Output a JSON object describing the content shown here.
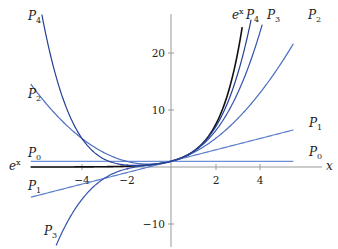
{
  "chart_data": {
    "type": "line",
    "title": "",
    "xlabel": "x",
    "ylabel": "",
    "xlim": [
      -6.5,
      6.3
    ],
    "ylim": [
      -12,
      27
    ],
    "grid": false,
    "x_ticks": [
      -4,
      -2,
      2,
      4
    ],
    "y_ticks": [
      -10,
      10,
      20
    ],
    "x_tick_labels": [
      "−4",
      "−2",
      "2",
      "4"
    ],
    "y_tick_labels": [
      "−10",
      "10",
      "20"
    ],
    "series": [
      {
        "name": "e^x",
        "label": "e",
        "sup": "x",
        "formula": "exp(x)",
        "color": "#111111",
        "domain": [
          -6.3,
          3.2
        ],
        "left_label": true
      },
      {
        "name": "P0",
        "label": "P",
        "sub": "0",
        "formula": "1",
        "color": "#6d8fd3",
        "domain": [
          -6.3,
          5.5
        ]
      },
      {
        "name": "P1",
        "label": "P",
        "sub": "1",
        "formula": "1+x",
        "color": "#5b7fcc",
        "domain": [
          -6.3,
          5.5
        ]
      },
      {
        "name": "P2",
        "label": "P",
        "sub": "2",
        "formula": "1+x+x^2/2",
        "color": "#4a6cc0",
        "domain": [
          -6.3,
          5.5
        ]
      },
      {
        "name": "P3",
        "label": "P",
        "sub": "3",
        "formula": "1+x+x^2/2+x^3/6",
        "color": "#3552ad",
        "domain": [
          -5.2,
          4.1
        ]
      },
      {
        "name": "P4",
        "label": "P",
        "sub": "4",
        "formula": "1+x+x^2/2+x^3/6+x^4/24",
        "color": "#243f94",
        "domain": [
          -6.3,
          3.6
        ]
      }
    ]
  },
  "labels": {
    "x_axis": "x",
    "ex_left": "e",
    "ex_left_sup": "x",
    "ex_top": "e",
    "ex_top_sup": "x",
    "P4_top": "P",
    "P4_top_sub": "4",
    "P3_top": "P",
    "P3_top_sub": "3",
    "P2_top": "P",
    "P2_top_sub": "2",
    "P1_right": "P",
    "P1_right_sub": "1",
    "P0_right": "P",
    "P0_right_sub": "0",
    "P4_left": "P",
    "P4_left_sub": "4",
    "P2_left": "P",
    "P2_left_sub": "2",
    "P0_left": "P",
    "P0_left_sub": "0",
    "P1_left": "P",
    "P1_left_sub": "1",
    "P3_bottom": "P",
    "P3_bottom_sub": "3"
  }
}
